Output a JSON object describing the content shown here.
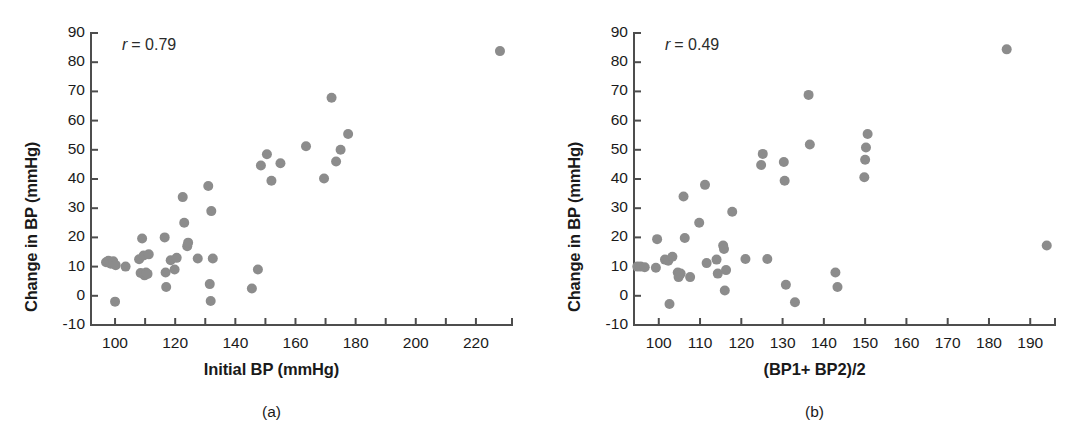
{
  "figure": {
    "background": "#ffffff",
    "marker_color": "#8c8c8c",
    "axis_color": "#4d4d4d",
    "text_color": "#1a1a1a"
  },
  "panels": [
    {
      "id": "a",
      "caption": "(a)",
      "annotation_var": "r",
      "annotation_value": "= 0.79",
      "chart_data": {
        "type": "scatter",
        "title": "",
        "xlabel": "Initial BP (mmHg)",
        "ylabel": "Change in BP (mmHg)",
        "xlim": [
          92,
          232
        ],
        "ylim": [
          -10,
          90
        ],
        "xticks": [
          100,
          110,
          120,
          130,
          140,
          150,
          160,
          170,
          180,
          190,
          200,
          210,
          220
        ],
        "xticklabels": [
          "100",
          "",
          "120",
          "",
          "140",
          "",
          "160",
          "",
          "180",
          "",
          "200",
          "",
          "220"
        ],
        "yticks": [
          -10,
          0,
          10,
          20,
          30,
          40,
          50,
          60,
          70,
          80,
          90
        ],
        "yticklabels": [
          "-10",
          "0",
          "10",
          "20",
          "30",
          "40",
          "50",
          "60",
          "70",
          "80",
          "90"
        ],
        "grid": false,
        "legend": "none",
        "annotations": [
          {
            "text": "r = 0.79",
            "x": 100,
            "y": 86
          }
        ],
        "points": [
          {
            "x": 97.0,
            "y": 11.5
          },
          {
            "x": 97.8,
            "y": 12.0
          },
          {
            "x": 98.6,
            "y": 11.0
          },
          {
            "x": 99.4,
            "y": 11.8
          },
          {
            "x": 100.2,
            "y": 10.5
          },
          {
            "x": 100.0,
            "y": -2.0
          },
          {
            "x": 103.5,
            "y": 10.0
          },
          {
            "x": 108.0,
            "y": 12.5
          },
          {
            "x": 108.5,
            "y": 7.8
          },
          {
            "x": 109.0,
            "y": 19.6
          },
          {
            "x": 109.5,
            "y": 13.8
          },
          {
            "x": 109.8,
            "y": 7.0
          },
          {
            "x": 110.3,
            "y": 8.0
          },
          {
            "x": 110.8,
            "y": 7.5
          },
          {
            "x": 111.2,
            "y": 14.2
          },
          {
            "x": 116.5,
            "y": 20.0
          },
          {
            "x": 116.8,
            "y": 8.0
          },
          {
            "x": 117.0,
            "y": 3.0
          },
          {
            "x": 118.5,
            "y": 12.2
          },
          {
            "x": 119.8,
            "y": 9.0
          },
          {
            "x": 120.5,
            "y": 13.0
          },
          {
            "x": 122.5,
            "y": 33.8
          },
          {
            "x": 123.0,
            "y": 25.0
          },
          {
            "x": 124.0,
            "y": 17.0
          },
          {
            "x": 124.3,
            "y": 18.2
          },
          {
            "x": 127.5,
            "y": 12.8
          },
          {
            "x": 131.0,
            "y": 37.6
          },
          {
            "x": 132.0,
            "y": 29.0
          },
          {
            "x": 132.5,
            "y": 12.8
          },
          {
            "x": 131.5,
            "y": 4.0
          },
          {
            "x": 131.8,
            "y": -1.8
          },
          {
            "x": 145.5,
            "y": 2.5
          },
          {
            "x": 147.5,
            "y": 9.0
          },
          {
            "x": 148.5,
            "y": 44.6
          },
          {
            "x": 150.5,
            "y": 48.5
          },
          {
            "x": 152.0,
            "y": 39.4
          },
          {
            "x": 155.0,
            "y": 45.4
          },
          {
            "x": 163.5,
            "y": 51.2
          },
          {
            "x": 169.5,
            "y": 40.2
          },
          {
            "x": 172.0,
            "y": 67.8
          },
          {
            "x": 173.5,
            "y": 46.0
          },
          {
            "x": 175.0,
            "y": 50.0
          },
          {
            "x": 177.5,
            "y": 55.4
          },
          {
            "x": 228.0,
            "y": 83.8
          }
        ]
      }
    },
    {
      "id": "b",
      "caption": "(b)",
      "annotation_var": "r",
      "annotation_value": "= 0.49",
      "chart_data": {
        "type": "scatter",
        "title": "",
        "xlabel": "(BP1+ BP2)/2",
        "ylabel": "Change in BP (mmHg)",
        "xlim": [
          94,
          196
        ],
        "ylim": [
          -10,
          90
        ],
        "xticks": [
          100,
          110,
          120,
          130,
          140,
          150,
          160,
          170,
          180,
          190
        ],
        "xticklabels": [
          "100",
          "110",
          "120",
          "130",
          "140",
          "150",
          "160",
          "170",
          "180",
          "190"
        ],
        "yticks": [
          -10,
          0,
          10,
          20,
          30,
          40,
          50,
          60,
          70,
          80,
          90
        ],
        "yticklabels": [
          "-10",
          "0",
          "10",
          "20",
          "30",
          "40",
          "50",
          "60",
          "70",
          "80",
          "90"
        ],
        "grid": false,
        "legend": "none",
        "annotations": [
          {
            "text": "r = 0.49",
            "x": 99,
            "y": 86
          }
        ],
        "points": [
          {
            "x": 94.8,
            "y": 10.0
          },
          {
            "x": 95.6,
            "y": 10.0
          },
          {
            "x": 96.6,
            "y": 9.8
          },
          {
            "x": 99.3,
            "y": 9.6
          },
          {
            "x": 99.6,
            "y": 19.4
          },
          {
            "x": 101.5,
            "y": 12.4
          },
          {
            "x": 102.3,
            "y": 12.0
          },
          {
            "x": 102.6,
            "y": -2.8
          },
          {
            "x": 103.3,
            "y": 13.4
          },
          {
            "x": 104.6,
            "y": 8.0
          },
          {
            "x": 104.8,
            "y": 6.4
          },
          {
            "x": 105.3,
            "y": 7.6
          },
          {
            "x": 106.0,
            "y": 34.0
          },
          {
            "x": 106.3,
            "y": 19.8
          },
          {
            "x": 107.6,
            "y": 6.4
          },
          {
            "x": 109.8,
            "y": 25.0
          },
          {
            "x": 111.2,
            "y": 38.0
          },
          {
            "x": 111.6,
            "y": 11.2
          },
          {
            "x": 114.0,
            "y": 12.4
          },
          {
            "x": 114.3,
            "y": 7.6
          },
          {
            "x": 115.6,
            "y": 17.2
          },
          {
            "x": 115.8,
            "y": 16.0
          },
          {
            "x": 116.3,
            "y": 8.8
          },
          {
            "x": 116.0,
            "y": 1.8
          },
          {
            "x": 117.8,
            "y": 28.8
          },
          {
            "x": 121.0,
            "y": 12.6
          },
          {
            "x": 124.8,
            "y": 44.8
          },
          {
            "x": 125.2,
            "y": 48.6
          },
          {
            "x": 126.3,
            "y": 12.6
          },
          {
            "x": 130.3,
            "y": 45.8
          },
          {
            "x": 130.5,
            "y": 39.4
          },
          {
            "x": 130.8,
            "y": 3.8
          },
          {
            "x": 133.0,
            "y": -2.2
          },
          {
            "x": 136.3,
            "y": 68.8
          },
          {
            "x": 136.6,
            "y": 51.8
          },
          {
            "x": 142.8,
            "y": 8.0
          },
          {
            "x": 143.3,
            "y": 3.0
          },
          {
            "x": 149.8,
            "y": 40.6
          },
          {
            "x": 150.0,
            "y": 46.6
          },
          {
            "x": 150.2,
            "y": 50.8
          },
          {
            "x": 150.6,
            "y": 55.4
          },
          {
            "x": 184.3,
            "y": 84.4
          },
          {
            "x": 194.0,
            "y": 17.2
          }
        ]
      }
    }
  ]
}
